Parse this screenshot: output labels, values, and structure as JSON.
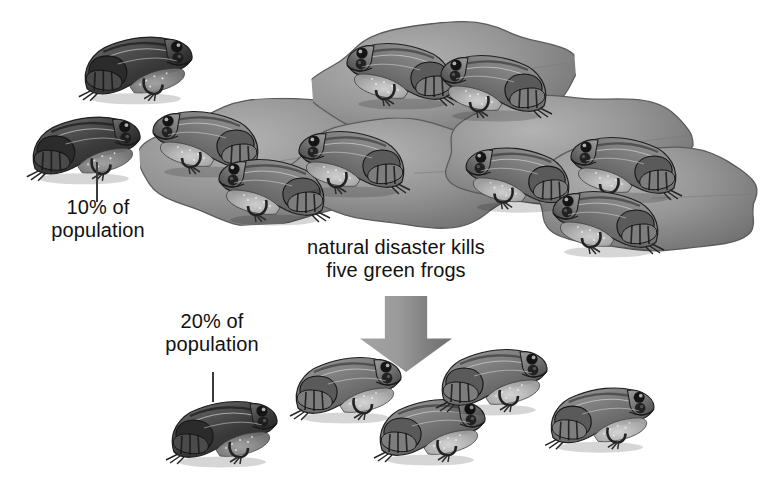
{
  "illustration": {
    "title": "genetic-drift-bottleneck-frogs",
    "background_color": "#ffffff",
    "ink_color": "#111111",
    "pad_color": "#8a8a8a",
    "arrow_color": "#8f8f8f"
  },
  "labels": {
    "top_callout": "10% of\npopulation",
    "event_caption": "natural disaster kills\nfive green frogs",
    "bottom_callout": "20% of\npopulation"
  },
  "arrow": {
    "name": "down-arrow",
    "direction": "down",
    "x": 360,
    "y": 296,
    "width": 92,
    "height": 76
  },
  "leaders": [
    {
      "name": "top-callout-leader",
      "x": 96,
      "y": 162,
      "height": 40
    },
    {
      "name": "bottom-callout-leader",
      "x": 212,
      "y": 372,
      "height": 30
    }
  ],
  "populations": {
    "before": {
      "name": "before-population",
      "total": 10,
      "dark_morph": 1,
      "dark_percent": "10%",
      "green_morph": 9
    },
    "after": {
      "name": "after-population",
      "total": 5,
      "dark_morph": 1,
      "dark_percent": "20%",
      "green_morph": 4,
      "killed": 5
    }
  },
  "lilypads": [
    {
      "name": "lilypad-left",
      "x": 140,
      "y": 98,
      "w": 268,
      "h": 126,
      "rot": -3
    },
    {
      "name": "lilypad-center-top",
      "x": 312,
      "y": 22,
      "w": 264,
      "h": 120,
      "rot": -4
    },
    {
      "name": "lilypad-center-low",
      "x": 286,
      "y": 118,
      "w": 244,
      "h": 110,
      "rot": 2
    },
    {
      "name": "lilypad-right-top",
      "x": 440,
      "y": 92,
      "w": 256,
      "h": 116,
      "rot": -2
    },
    {
      "name": "lilypad-right-low",
      "x": 528,
      "y": 142,
      "w": 236,
      "h": 112,
      "rot": 3
    }
  ],
  "frogs_before": [
    {
      "name": "frog-dark-upper-left",
      "x": 78,
      "y": 18,
      "scale": 1.02,
      "facing": "right",
      "morph": "dark"
    },
    {
      "name": "frog-dark-lower-left",
      "x": 26,
      "y": 98,
      "scale": 1.02,
      "facing": "right",
      "morph": "dark"
    },
    {
      "name": "frog-pad-left-upper",
      "x": 148,
      "y": 92,
      "scale": 1.0,
      "facing": "left",
      "morph": "green"
    },
    {
      "name": "frog-pad-left-lower",
      "x": 214,
      "y": 140,
      "scale": 1.0,
      "facing": "left",
      "morph": "green"
    },
    {
      "name": "frog-pad-center-top",
      "x": 342,
      "y": 24,
      "scale": 1.0,
      "facing": "left",
      "morph": "green"
    },
    {
      "name": "frog-pad-center-right",
      "x": 436,
      "y": 36,
      "scale": 1.0,
      "facing": "left",
      "morph": "green"
    },
    {
      "name": "frog-pad-center-low",
      "x": 294,
      "y": 112,
      "scale": 1.0,
      "facing": "left",
      "morph": "green"
    },
    {
      "name": "frog-pad-right-mid",
      "x": 460,
      "y": 128,
      "scale": 0.98,
      "facing": "left",
      "morph": "green"
    },
    {
      "name": "frog-pad-right-upper",
      "x": 566,
      "y": 118,
      "scale": 1.0,
      "facing": "left",
      "morph": "green"
    },
    {
      "name": "frog-pad-right-lower",
      "x": 548,
      "y": 172,
      "scale": 1.0,
      "facing": "left",
      "morph": "green"
    }
  ],
  "frogs_after": [
    {
      "name": "frog-after-dark",
      "x": 164,
      "y": 382,
      "scale": 1.0,
      "facing": "right",
      "morph": "dark"
    },
    {
      "name": "frog-after-green-1",
      "x": 288,
      "y": 338,
      "scale": 1.0,
      "facing": "right",
      "morph": "green"
    },
    {
      "name": "frog-after-green-2",
      "x": 372,
      "y": 380,
      "scale": 1.0,
      "facing": "right",
      "morph": "green"
    },
    {
      "name": "frog-after-green-3",
      "x": 434,
      "y": 330,
      "scale": 1.0,
      "facing": "right",
      "morph": "green"
    },
    {
      "name": "frog-after-green-4",
      "x": 542,
      "y": 368,
      "scale": 0.98,
      "facing": "right",
      "morph": "green"
    }
  ],
  "label_positions": {
    "top_callout": {
      "x": 18,
      "y": 196,
      "w": 160
    },
    "event_caption": {
      "x": 278,
      "y": 236,
      "w": 236
    },
    "bottom_callout": {
      "x": 132,
      "y": 310,
      "w": 160
    }
  }
}
